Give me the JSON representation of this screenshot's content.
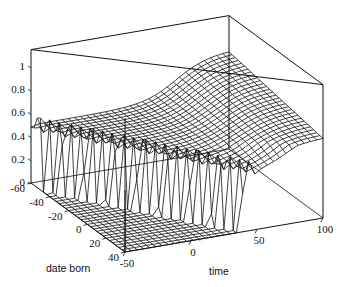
{
  "chart_data": {
    "type": "surface3d",
    "title": "",
    "xlabel": "date born",
    "ylabel": "time",
    "zlabel": "",
    "x_axis": {
      "label": "date born",
      "range": [
        -60,
        40
      ],
      "ticks": [
        -60,
        -40,
        -20,
        0,
        20,
        40
      ]
    },
    "y_axis": {
      "label": "time",
      "range": [
        -50,
        100
      ],
      "ticks": [
        -50,
        0,
        50,
        100
      ]
    },
    "z_axis": {
      "label": "",
      "range": [
        0,
        1.15
      ],
      "ticks": [
        0,
        0.2,
        0.4,
        0.6,
        0.8,
        1
      ]
    },
    "z_tick_labels": [
      "0",
      "0.2",
      "0.4",
      "0.6",
      "0.8",
      "1"
    ],
    "x_tick_labels": [
      "-60",
      "-40",
      "-20",
      "0",
      "20",
      "40"
    ],
    "y_tick_labels": [
      "-50",
      "0",
      "50",
      "100"
    ],
    "grid": false,
    "legend": null,
    "sample_surface": {
      "date_born": [
        -60,
        -40,
        -20,
        0,
        20,
        40
      ],
      "time": [
        -50,
        -25,
        0,
        25,
        50,
        75,
        100
      ],
      "z": [
        [
          0.62,
          0.55,
          0.5,
          0.52,
          0.65,
          0.82,
          0.9
        ],
        [
          0.0,
          0.6,
          0.52,
          0.5,
          0.6,
          0.78,
          0.86
        ],
        [
          0.0,
          0.0,
          0.62,
          0.5,
          0.56,
          0.72,
          0.8
        ],
        [
          0.0,
          0.0,
          0.58,
          0.55,
          0.52,
          0.66,
          0.74
        ],
        [
          0.0,
          0.0,
          0.0,
          0.6,
          0.5,
          0.6,
          0.68
        ],
        [
          0.0,
          0.0,
          0.0,
          0.0,
          0.62,
          0.55,
          0.62
        ]
      ]
    }
  },
  "labels": {
    "date_axis_title": "date born",
    "time_axis_title": "time"
  }
}
